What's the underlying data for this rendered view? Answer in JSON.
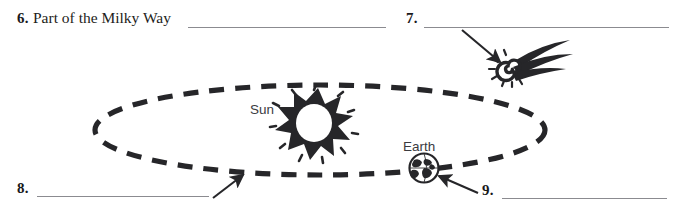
{
  "worksheet": {
    "items": [
      {
        "number": "6.",
        "text": "Part of the Milky Way"
      },
      {
        "number": "7.",
        "text": ""
      },
      {
        "number": "8.",
        "text": ""
      },
      {
        "number": "9.",
        "text": ""
      }
    ]
  },
  "diagram": {
    "sun_label": "Sun",
    "earth_label": "Earth",
    "icons": {
      "sun": "sun-starburst-icon",
      "earth": "earth-globe-icon",
      "comet": "comet-icon",
      "orbit": "dashed-orbit-ellipse"
    }
  },
  "colors": {
    "ink": "#19191b",
    "line": "#8b8b90",
    "label": "#3b3b3f",
    "art": "#262629",
    "background": "#ffffff"
  }
}
